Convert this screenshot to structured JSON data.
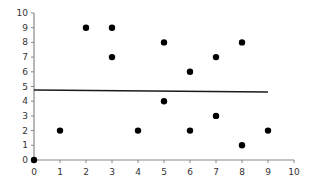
{
  "chart_data": {
    "type": "scatter",
    "title": "",
    "xlabel": "",
    "ylabel": "",
    "xlim": [
      0,
      10
    ],
    "ylim": [
      0,
      10
    ],
    "grid": false,
    "legend": null,
    "x_ticks": [
      "0",
      "1",
      "2",
      "3",
      "4",
      "5",
      "6",
      "7",
      "8",
      "9",
      "10"
    ],
    "y_ticks": [
      "0",
      "1",
      "2",
      "3",
      "4",
      "5",
      "6",
      "7",
      "8",
      "9",
      "10"
    ],
    "series": [
      {
        "name": "points",
        "kind": "scatter",
        "color": "#000000",
        "points": [
          {
            "x": 0,
            "y": 0
          },
          {
            "x": 1,
            "y": 2
          },
          {
            "x": 2,
            "y": 9
          },
          {
            "x": 3,
            "y": 9
          },
          {
            "x": 3,
            "y": 7
          },
          {
            "x": 4,
            "y": 2
          },
          {
            "x": 5,
            "y": 8
          },
          {
            "x": 5,
            "y": 4
          },
          {
            "x": 6,
            "y": 6
          },
          {
            "x": 6,
            "y": 2
          },
          {
            "x": 7,
            "y": 7
          },
          {
            "x": 7,
            "y": 3
          },
          {
            "x": 8,
            "y": 8
          },
          {
            "x": 8,
            "y": 1
          },
          {
            "x": 9,
            "y": 2
          }
        ]
      },
      {
        "name": "trend line",
        "kind": "line",
        "color": "#1a1a1a",
        "points": [
          {
            "x": 0,
            "y": 4.76
          },
          {
            "x": 9,
            "y": 4.63
          }
        ]
      }
    ]
  },
  "layout": {
    "plot_left": 34,
    "plot_right": 294,
    "plot_top": 13,
    "plot_bottom": 160,
    "axis_color": "#888888"
  }
}
